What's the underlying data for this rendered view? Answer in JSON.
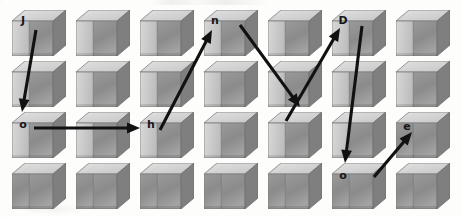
{
  "image": {
    "kind": "visual-captcha",
    "width": 462,
    "height": 217,
    "background_color": "#fdfdfb",
    "description": "Grid of shaded 3D cubes with letters on selected cubes, connected by black arrows indicating reading order"
  },
  "grid": {
    "rows": 4,
    "columns": 7,
    "cube_count": 28,
    "cube_width": 54,
    "cube_height": 46,
    "origin_x": 12,
    "origin_y": 10,
    "step_x": 64,
    "step_y": 51,
    "cube_colors": {
      "front_face": "#c9c9c9",
      "right_face": "#8f8f8f",
      "top_face": "#dcdcdc",
      "outline": "#6e6e6e"
    }
  },
  "letters": [
    {
      "id": "letter-1",
      "char": "J",
      "row": 0,
      "col": 0,
      "x": 16,
      "y": 15
    },
    {
      "id": "letter-2",
      "char": "n",
      "row": 0,
      "col": 3,
      "x": 208,
      "y": 15
    },
    {
      "id": "letter-3",
      "char": "D",
      "row": 0,
      "col": 5,
      "x": 336,
      "y": 15
    },
    {
      "id": "letter-4",
      "char": "o",
      "row": 2,
      "col": 0,
      "x": 16,
      "y": 119
    },
    {
      "id": "letter-5",
      "char": "h",
      "row": 2,
      "col": 2,
      "x": 144,
      "y": 119
    },
    {
      "id": "letter-6",
      "char": "e",
      "row": 2,
      "col": 6,
      "x": 400,
      "y": 121
    },
    {
      "id": "letter-7",
      "char": "o",
      "row": 3,
      "col": 5,
      "x": 336,
      "y": 170
    }
  ],
  "answer": {
    "reading_order": [
      "J",
      "o",
      "h",
      "n",
      "D",
      "o",
      "e"
    ],
    "text": "JohnDoe"
  },
  "arrows": [
    {
      "id": "arrow-1",
      "from_letter": "J",
      "to_letter": "o",
      "from": [
        36,
        30
      ],
      "to": [
        22,
        112
      ],
      "color": "#111111"
    },
    {
      "id": "arrow-2",
      "from_letter": "o",
      "to_letter": "h",
      "from": [
        34,
        128
      ],
      "to": [
        140,
        128
      ],
      "color": "#111111"
    },
    {
      "id": "arrow-3",
      "from_letter": "h",
      "to_letter": "n",
      "from": [
        160,
        130
      ],
      "to": [
        212,
        30
      ],
      "color": "#111111"
    },
    {
      "id": "arrow-4",
      "from_letter": "n",
      "to_letter": "D",
      "from": [
        240,
        25
      ],
      "to": [
        300,
        107
      ],
      "color": "#111111"
    },
    {
      "id": "arrow-5",
      "from_letter": "D",
      "to_letter": "o",
      "from": [
        286,
        121
      ],
      "to": [
        340,
        28
      ],
      "color": "#111111"
    },
    {
      "id": "arrow-6",
      "from_letter": "D",
      "to_letter": "o2",
      "from": [
        362,
        26
      ],
      "to": [
        345,
        163
      ],
      "color": "#111111"
    },
    {
      "id": "arrow-7",
      "from_letter": "o2",
      "to_letter": "e",
      "from": [
        374,
        177
      ],
      "to": [
        412,
        132
      ],
      "color": "#111111"
    }
  ]
}
